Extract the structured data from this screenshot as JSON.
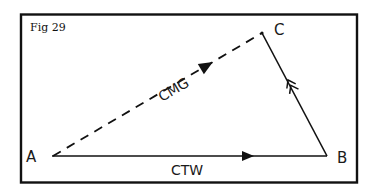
{
  "figure": {
    "title": "Fig 29",
    "colors": {
      "stroke": "#111111",
      "background": "#ffffff"
    }
  },
  "points": {
    "A": {
      "label": "A",
      "x": 52,
      "y": 156
    },
    "B": {
      "label": "B",
      "x": 327,
      "y": 156
    },
    "C": {
      "label": "C",
      "x": 262,
      "y": 33
    }
  },
  "edges": {
    "ctw": {
      "label": "CTW",
      "from": "A",
      "to": "B",
      "style": "solid",
      "arrow": "single"
    },
    "cmg": {
      "label": "CMG",
      "from": "A",
      "to": "C",
      "style": "dashed",
      "arrow": "single"
    },
    "cb": {
      "label": "",
      "from": "B",
      "to": "C",
      "style": "solid",
      "arrow": "double-chevron"
    }
  }
}
